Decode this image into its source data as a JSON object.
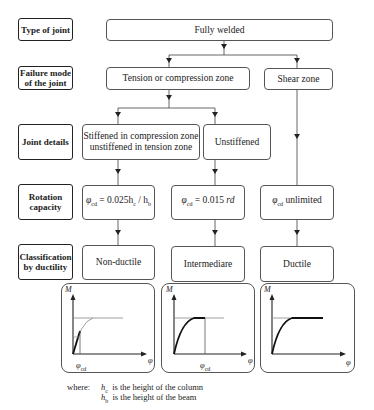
{
  "row_labels": {
    "type_of_joint": "Type of joint",
    "failure_mode_l1": "Failure mode",
    "failure_mode_l2": "of the joint",
    "joint_details": "Joint details",
    "rotation_capacity_l1": "Rotation",
    "rotation_capacity_l2": "capacity",
    "classification_l1": "Classification",
    "classification_l2": "by ductility"
  },
  "nodes": {
    "fully_welded": "Fully welded",
    "tension_compression": "Tension or compression zone",
    "shear_zone": "Shear zone",
    "stiffened_l1": "Stiffened in compression zone",
    "stiffened_l2": "unstiffened in tension zone",
    "unstiffened": "Unstiffened",
    "formula_1_lhs": "φ",
    "formula_1_sub": "cd",
    "formula_1_rhs": " = 0.025h",
    "formula_1_sub2": "c",
    "formula_1_div": " / h",
    "formula_1_sub3": "b",
    "formula_2_lhs": "φ",
    "formula_2_sub": "cd",
    "formula_2_rhs": " = 0.015 ",
    "formula_2_unit": "rd",
    "formula_3_lhs": "φ",
    "formula_3_sub": "cd",
    "formula_3_rhs": " unlimited",
    "non_ductile": "Non-ductile",
    "intermediare": "Intermediare",
    "ductile": "Ductile"
  },
  "graphs": {
    "y_axis": "M",
    "x_axis": "φ",
    "phi_cd_label": "φ",
    "phi_cd_sub": "cd"
  },
  "legend": {
    "where": "where:",
    "hc_symbol": "h",
    "hc_sub": "c",
    "hc_text": "is the height of the column",
    "hb_symbol": "h",
    "hb_sub": "b",
    "hb_text": "is the height of the beam"
  }
}
